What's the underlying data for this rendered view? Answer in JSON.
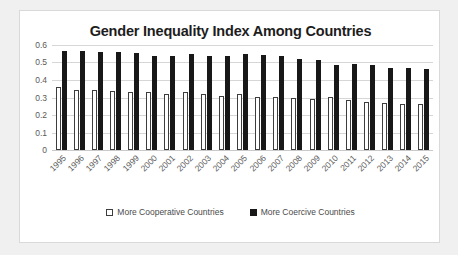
{
  "chart_data": {
    "type": "bar",
    "title": "Gender Inequality Index Among Countries",
    "xlabel": "",
    "ylabel": "",
    "ylim": [
      0,
      0.6
    ],
    "yticks": [
      "0",
      "0.1",
      "0.2",
      "0.3",
      "0.4",
      "0.5",
      "0.6"
    ],
    "ytick_values": [
      0,
      0.1,
      0.2,
      0.3,
      0.4,
      0.5,
      0.6
    ],
    "grid": true,
    "legend_position": "bottom-center",
    "categories": [
      "1995",
      "1996",
      "1997",
      "1998",
      "1999",
      "2000",
      "2001",
      "2002",
      "2003",
      "2004",
      "2005",
      "2006",
      "2007",
      "2008",
      "2009",
      "2010",
      "2011",
      "2012",
      "2013",
      "2014",
      "2015"
    ],
    "series": [
      {
        "name": "More Cooperative Countries",
        "color": "#ffffff",
        "border_color": "#3d3d3d",
        "values": [
          0.36,
          0.343,
          0.343,
          0.335,
          0.33,
          0.329,
          0.318,
          0.333,
          0.322,
          0.309,
          0.318,
          0.303,
          0.301,
          0.298,
          0.29,
          0.302,
          0.286,
          0.274,
          0.267,
          0.263,
          0.262
        ]
      },
      {
        "name": "More Coercive Countries",
        "color": "#181818",
        "border_color": "#181818",
        "values": [
          0.563,
          0.566,
          0.559,
          0.558,
          0.556,
          0.539,
          0.537,
          0.551,
          0.54,
          0.54,
          0.549,
          0.544,
          0.535,
          0.519,
          0.516,
          0.486,
          0.491,
          0.484,
          0.469,
          0.466,
          0.463
        ]
      }
    ]
  },
  "legend": {
    "items": [
      {
        "label": "More Cooperative Countries",
        "swatch": "hollow-square"
      },
      {
        "label": "More Coercive Countries",
        "swatch": "filled-square"
      }
    ]
  },
  "colors": {
    "page_background": "#f0f0f0",
    "card_background": "#ffffff",
    "card_border": "#d9d9d9",
    "gridline": "#d6d6d6",
    "title_text": "#1d1d1d",
    "tick_text": "#5a5a5a",
    "series_cooperative": "#ffffff",
    "series_coercive": "#181818"
  }
}
